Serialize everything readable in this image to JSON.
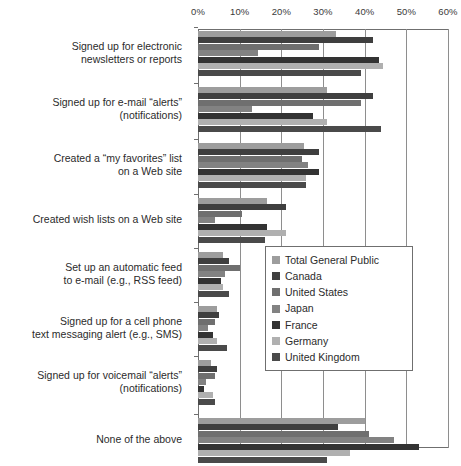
{
  "chart_data": {
    "type": "bar",
    "orientation": "horizontal",
    "title": "",
    "xlabel": "",
    "ylabel": "",
    "xlim": [
      0,
      60
    ],
    "xticks": [
      0,
      10,
      20,
      30,
      40,
      50,
      60
    ],
    "xtick_labels": [
      "0%",
      "10%",
      "20%",
      "30%",
      "40%",
      "50%",
      "60%"
    ],
    "grid": true,
    "legend_position": "center-right",
    "categories": [
      "Signed up for electronic newsletters or reports",
      "Signed up for e-mail “alerts” (notifications)",
      "Created a “my favorites” list on a Web site",
      "Created wish lists on a Web site",
      "Set up an automatic feed to e-mail (e.g., RSS feed)",
      "Signed up for a cell phone text messaging alert (e.g., SMS)",
      "Signed up for voicemail “alerts” (notifications)",
      "None of the above"
    ],
    "category_lines": [
      [
        "Signed up for electronic",
        "newsletters or reports"
      ],
      [
        "Signed up for e-mail “alerts”",
        "(notifications)"
      ],
      [
        "Created a “my favorites” list",
        "on a Web site"
      ],
      [
        "Created wish lists on a Web site"
      ],
      [
        "Set up an automatic feed",
        "to e-mail (e.g., RSS feed)"
      ],
      [
        "Signed up for a cell phone",
        "text messaging alert (e.g., SMS)"
      ],
      [
        "Signed up for voicemail “alerts”",
        "(notifications)"
      ],
      [
        "None of the above"
      ]
    ],
    "series": [
      {
        "name": "Total General Public",
        "color": "#9d9d9d",
        "values": [
          33,
          31,
          25.5,
          16.5,
          6,
          4.5,
          3,
          40
        ]
      },
      {
        "name": "Canada",
        "color": "#3f3f3f",
        "values": [
          42,
          42,
          29,
          21,
          7.5,
          5,
          4.5,
          33.5
        ]
      },
      {
        "name": "United States",
        "color": "#6f6f6f",
        "values": [
          29,
          39,
          25,
          10.5,
          10,
          4,
          4,
          41
        ]
      },
      {
        "name": "Japan",
        "color": "#828282",
        "values": [
          14.5,
          13,
          26.5,
          4,
          6.5,
          2.5,
          2,
          47
        ]
      },
      {
        "name": "France",
        "color": "#333333",
        "values": [
          43.5,
          27.5,
          29,
          16.5,
          5.5,
          3.5,
          1.5,
          53
        ]
      },
      {
        "name": "Germany",
        "color": "#b0b0b0",
        "values": [
          44.5,
          31,
          26,
          21,
          6,
          4.5,
          3.5,
          36.5
        ]
      },
      {
        "name": "United Kingdom",
        "color": "#4a4a4a",
        "values": [
          39,
          44,
          26,
          16,
          7.5,
          7,
          4,
          31
        ]
      }
    ]
  },
  "legend": {
    "items": [
      "Total General Public",
      "Canada",
      "United States",
      "Japan",
      "France",
      "Germany",
      "United Kingdom"
    ]
  },
  "caption": {
    "text": ""
  }
}
